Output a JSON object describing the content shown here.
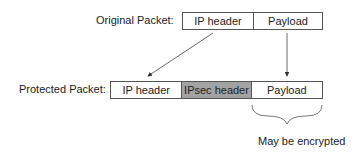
{
  "original": {
    "label": "Original Packet:",
    "cells": [
      "IP header",
      "Payload"
    ]
  },
  "protected": {
    "label": "Protected Packet:",
    "cells": [
      "IP header",
      "IPsec header",
      "Payload"
    ]
  },
  "annotation": "May be encrypted",
  "colors": {
    "ipsec_fill": "#a3a3a3",
    "stroke": "#555555"
  }
}
